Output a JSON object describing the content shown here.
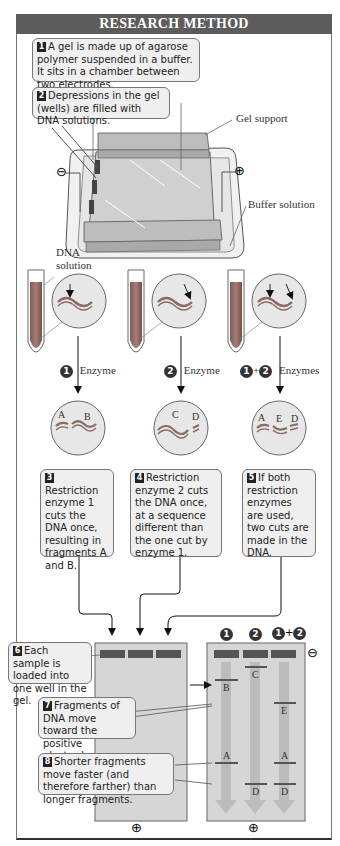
{
  "header": {
    "title": "RESEARCH METHOD"
  },
  "steps": [
    {
      "num": "1",
      "text": "A gel is made up of agarose polymer suspended in a buffer. It sits in a chamber between two electrodes."
    },
    {
      "num": "2",
      "text": "Depressions in the gel (wells) are filled with DNA solutions."
    },
    {
      "num": "3",
      "text": "Restriction enzyme 1 cuts the DNA once, resulting in fragments A and B."
    },
    {
      "num": "4",
      "text": "Restriction enzyme 2 cuts the DNA once, at a sequence different than the one cut by enzyme 1."
    },
    {
      "num": "5",
      "text": "If both restriction enzymes are used, two cuts are made in the DNA."
    },
    {
      "num": "6",
      "text": "Each sample is loaded into one well in the gel."
    },
    {
      "num": "7",
      "text": "Fragments of DNA move toward the positive electrode."
    },
    {
      "num": "8",
      "text": "Shorter fragments move faster (and therefore farther) than longer fragments."
    }
  ],
  "apparatus": {
    "gel_support_label": "Gel support",
    "buffer_solution_label": "Buffer solution",
    "negative_symbol": "⊖",
    "positive_symbol": "⊕"
  },
  "tubes": {
    "dna_solution_label_line1": "DNA",
    "dna_solution_label_line2": "solution",
    "columns": [
      {
        "badge": "1",
        "badge2": "",
        "plus": "",
        "enzyme_label": "Enzyme",
        "fragments": [
          "A",
          "B"
        ]
      },
      {
        "badge": "2",
        "badge2": "",
        "plus": "",
        "enzyme_label": "Enzyme",
        "fragments": [
          "C",
          "D"
        ]
      },
      {
        "badge": "1",
        "badge2": "2",
        "plus": "+",
        "enzyme_label": "Enzymes",
        "fragments": [
          "A",
          "E",
          "D"
        ]
      }
    ]
  },
  "gel_result": {
    "lane_headers": [
      {
        "badge": "1"
      },
      {
        "badge": "2"
      },
      {
        "badge": "1",
        "plus": "+",
        "badge2": "2"
      }
    ],
    "bands": {
      "lane1": [
        "B",
        "A"
      ],
      "lane2": [
        "C",
        "D"
      ],
      "lane3": [
        "E",
        "A",
        "D"
      ]
    },
    "negative_symbol": "⊖",
    "positive_symbol_left": "⊕",
    "positive_symbol_right": "⊕"
  },
  "colors": {
    "header_bg": "#5c5c5c",
    "callout_bg": "#efefef",
    "gel": "#cfcfcf",
    "well": "#555555",
    "dna_red": "#9a6a66",
    "lane_arrow": "#b8b8b8"
  }
}
